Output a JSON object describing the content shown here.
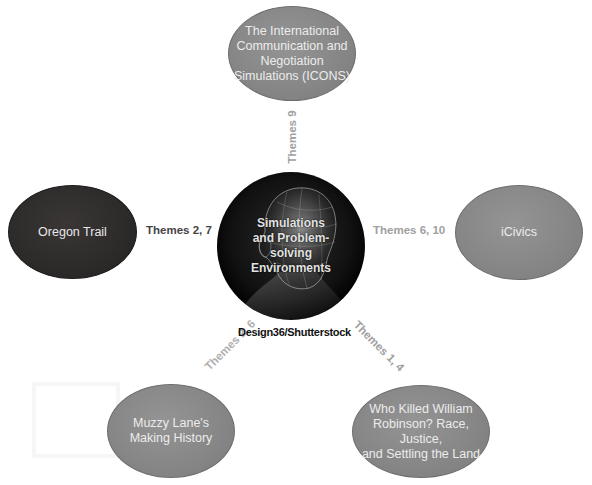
{
  "diagram": {
    "hub": {
      "label_lines": [
        "Simulations",
        "and Problem-",
        "solving",
        "Environments"
      ],
      "image": "human-head-wireframe",
      "credit": "Design36/Shutterstock"
    },
    "nodes": [
      {
        "id": "icons",
        "label_lines": [
          "The International",
          "Communication and",
          "Negotiation",
          "Simulations (ICONS)"
        ],
        "themes": "Themes 9",
        "fill": "#878787"
      },
      {
        "id": "oregon-trail",
        "label_lines": [
          "Oregon Trail"
        ],
        "themes": "Themes 2, 7",
        "fill": "#2d2a2a"
      },
      {
        "id": "icivics",
        "label_lines": [
          "iCivics"
        ],
        "themes": "Themes 6, 10",
        "fill": "#878787"
      },
      {
        "id": "muzzy-lane",
        "label_lines": [
          "Muzzy Lane's",
          "Making History"
        ],
        "themes": "Themes 2, 6",
        "fill": "#878787"
      },
      {
        "id": "who-killed",
        "label_lines": [
          "Who Killed William",
          "Robinson? Race, Justice,",
          "and Settling the Land"
        ],
        "themes": "Themes 1, 4",
        "fill": "#878787"
      }
    ],
    "colors": {
      "theme_dark": "#444444",
      "theme_light": "#a0a0a0",
      "node_gray": "#878787",
      "node_dark": "#2d2a2a",
      "hub": "#000000"
    }
  }
}
